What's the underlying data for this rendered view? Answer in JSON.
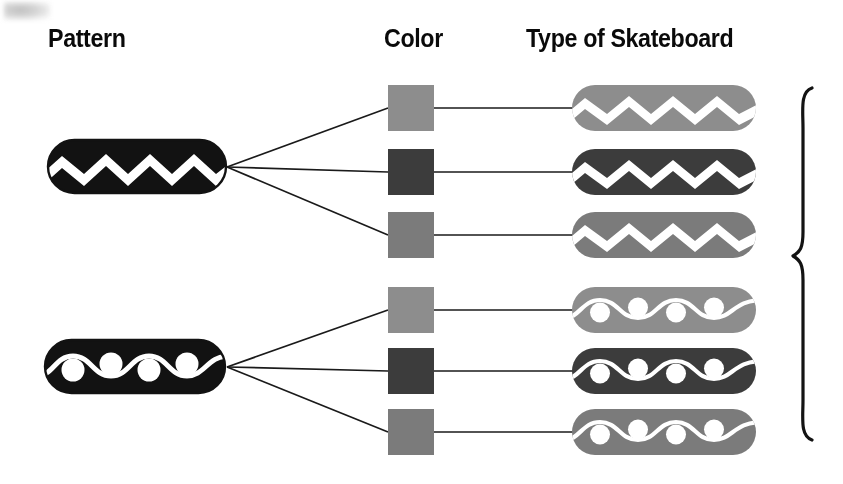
{
  "headers": {
    "pattern": "Pattern",
    "color": "Color",
    "type": "Type of Skateboard"
  },
  "colors": {
    "ink": "#121212",
    "line": "#1a1a1a",
    "white": "#ffffff",
    "light_gray": "#8d8d8d",
    "dark_gray": "#3c3c3c",
    "medium_gray": "#7b7b7b",
    "page_background": "#ffffff"
  },
  "patterns": [
    {
      "id": "zigzag",
      "label": "zigzag",
      "fill": "#121212",
      "stripe": "#ffffff"
    },
    {
      "id": "wave",
      "label": "wave with dots",
      "fill": "#121212",
      "stripe": "#ffffff"
    }
  ],
  "color_options": [
    {
      "label": "light gray",
      "hex": "#8d8d8d"
    },
    {
      "label": "dark gray",
      "hex": "#3c3c3c"
    },
    {
      "label": "medium gray",
      "hex": "#7b7b7b"
    }
  ],
  "outcomes": [
    {
      "pattern": "zigzag",
      "color": "light gray",
      "hex": "#8d8d8d"
    },
    {
      "pattern": "zigzag",
      "color": "dark gray",
      "hex": "#3c3c3c"
    },
    {
      "pattern": "zigzag",
      "color": "medium gray",
      "hex": "#7b7b7b"
    },
    {
      "pattern": "wave",
      "color": "light gray",
      "hex": "#8d8d8d"
    },
    {
      "pattern": "wave",
      "color": "dark gray",
      "hex": "#3c3c3c"
    },
    {
      "pattern": "wave",
      "color": "medium gray",
      "hex": "#7b7b7b"
    }
  ],
  "brace": {
    "label": "total outcomes bracket",
    "count": 6
  }
}
